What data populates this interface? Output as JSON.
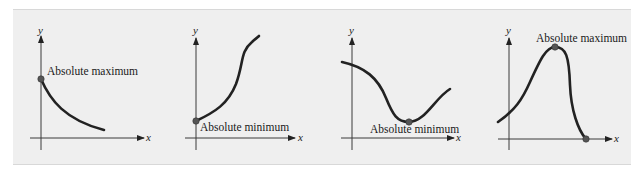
{
  "figure": {
    "colors": {
      "panel_background": "#efefef",
      "curve": "#222222",
      "axis": "#3a3a3a",
      "point": "#555555"
    },
    "graphs": [
      {
        "id": "graph-1",
        "x_axis_label": "x",
        "y_axis_label": "y",
        "annotation": "Absolute maximum",
        "extremum_type": "maximum",
        "extremum_location": "left endpoint",
        "curve_shape": "decreasing, concave up"
      },
      {
        "id": "graph-2",
        "x_axis_label": "x",
        "y_axis_label": "y",
        "annotation": "Absolute minimum",
        "extremum_type": "minimum",
        "extremum_location": "left endpoint",
        "curve_shape": "increasing S-curve"
      },
      {
        "id": "graph-3",
        "x_axis_label": "x",
        "y_axis_label": "y",
        "annotation": "Absolute minimum",
        "extremum_type": "minimum",
        "extremum_location": "interior valley",
        "curve_shape": "decreasing then increasing"
      },
      {
        "id": "graph-4",
        "x_axis_label": "x",
        "y_axis_label": "y",
        "annotation": "Absolute maximum",
        "extremum_type": "maximum",
        "extremum_location": "interior peak",
        "curve_shape": "rising to peak then falling to the x-axis"
      }
    ]
  }
}
